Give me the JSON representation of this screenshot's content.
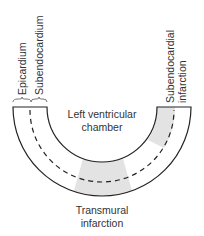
{
  "diagram": {
    "labels": {
      "epicardium": "Epicardium",
      "subendocardium": "Subendocardium",
      "subendocardial_infarction_line1": "Subendocardial",
      "subendocardial_infarction_line2": "infarction",
      "chamber_line1": "Left ventricular",
      "chamber_line2": "chamber",
      "transmural_line1": "Transmural",
      "transmural_line2": "infarction"
    },
    "colors": {
      "stroke": "#222222",
      "infarct_fill": "#e3e3e3",
      "text": "#333333"
    }
  }
}
